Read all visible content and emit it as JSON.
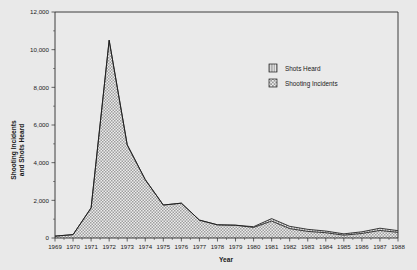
{
  "chart_data": {
    "type": "area",
    "stacked": true,
    "title": "",
    "xlabel": "Year",
    "ylabel": "Shooting Incidents and Shots Heard",
    "ylabel_lines": [
      "Shooting Incidents",
      "and Shots Heard"
    ],
    "categories": [
      1969,
      1970,
      1971,
      1972,
      1973,
      1974,
      1975,
      1976,
      1977,
      1978,
      1979,
      1980,
      1981,
      1982,
      1983,
      1984,
      1985,
      1986,
      1987,
      1988
    ],
    "x_tick_labels": [
      "1969",
      "1970",
      "1971",
      "1972",
      "1973",
      "1974",
      "1975",
      "1976",
      "1977",
      "1978",
      "1979",
      "1980",
      "1981",
      "1982",
      "1983",
      "1984",
      "1985",
      "1986",
      "1987",
      "1988"
    ],
    "y_tick_labels": [
      "0",
      "2,000",
      "4,000",
      "6,000",
      "8,000",
      "10,000",
      "12,000"
    ],
    "y_tick_values": [
      0,
      2000,
      4000,
      6000,
      8000,
      10000,
      12000
    ],
    "ylim": [
      0,
      12000
    ],
    "xlim": [
      1969,
      1988
    ],
    "grid": false,
    "minor_ticks": true,
    "series": [
      {
        "name": "Shooting Incidents",
        "pattern": "stipple-checker",
        "values": [
          100,
          180,
          1600,
          10500,
          4950,
          3100,
          1750,
          1850,
          950,
          700,
          680,
          560,
          900,
          500,
          350,
          280,
          150,
          240,
          400,
          300
        ]
      },
      {
        "name": "Shots Heard",
        "pattern": "vertical-stripes",
        "values": [
          0,
          0,
          0,
          0,
          0,
          0,
          0,
          0,
          0,
          0,
          0,
          40,
          130,
          120,
          110,
          90,
          70,
          90,
          120,
          90
        ]
      }
    ],
    "legend": {
      "position": "inside-upper-right",
      "entries": [
        {
          "label": "Shots Heard",
          "pattern": "vertical-stripes"
        },
        {
          "label": "Shooting Incidents",
          "pattern": "stipple-checker"
        }
      ]
    },
    "colors": {
      "background": "#e9e9e9",
      "plot_background": "#eaeaea",
      "axis": "#2b2b2b",
      "series_outline": "#1c1c1c",
      "fill_light": "#d2d2d2",
      "text": "#1a1a1a"
    }
  }
}
